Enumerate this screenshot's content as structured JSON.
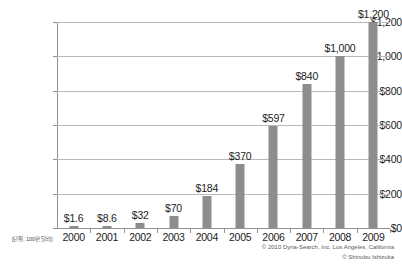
{
  "chart_data": {
    "type": "bar",
    "title": "",
    "subtitle": "",
    "xlabel": "",
    "ylabel": "",
    "unit_note": "[단위: 100만 달러]",
    "categories": [
      "2000",
      "2001",
      "2002",
      "2003",
      "2004",
      "2005",
      "2006",
      "2007",
      "2008",
      "2009"
    ],
    "values": [
      1.6,
      8.6,
      32,
      70,
      184,
      370,
      597,
      840,
      1000,
      1200
    ],
    "value_labels": [
      "$1.6",
      "$8.6",
      "$32",
      "$70",
      "$184",
      "$370",
      "$597",
      "$840",
      "$1,000",
      "$1,200"
    ],
    "ylim": [
      0,
      1200
    ],
    "yticks": [
      0,
      200,
      400,
      600,
      800,
      1000,
      1200
    ],
    "ytick_labels": [
      "$0",
      "$200",
      "$400",
      "$600",
      "$800",
      "$1,000",
      "$1,200"
    ],
    "grid": true,
    "legend": "none",
    "bar_color": "#8d8d8d",
    "grid_color": "#b9b9b9",
    "axis_color": "#8f8f8f",
    "text_color": "#1c1c1c",
    "background": "#ffffff"
  },
  "credits": {
    "line1": "© 2010 Dyna-Search, Inc. Los Angeles, California",
    "line2": "© Shinobu Ishizuka"
  }
}
